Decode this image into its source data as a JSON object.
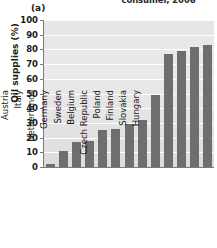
{
  "panel": {
    "label": "(a)"
  },
  "chart_data": {
    "type": "bar",
    "title": "consumer, 2006",
    "xlabel": "",
    "ylabel": "Oil supplies (%)",
    "ylim": [
      0,
      100
    ],
    "ytick_labels": [
      "100",
      "90",
      "80",
      "70",
      "60",
      "50",
      "40",
      "30",
      "20",
      "10",
      "0"
    ],
    "yticks": [
      100,
      90,
      80,
      70,
      60,
      50,
      40,
      30,
      20,
      10,
      0
    ],
    "grid": true,
    "legend": "none",
    "bar_color": "#6e6e6e",
    "plot_background": "#e6e6e6",
    "categories": [
      "Denmark",
      "France",
      "Austria",
      "Italy",
      "Netherlands",
      "Germany",
      "Sweden",
      "Belgium",
      "Czech Republic",
      "Poland",
      "Finland",
      "Slovakia",
      "Hungary"
    ],
    "values": [
      2,
      11,
      17,
      18,
      25,
      26,
      29,
      32,
      49,
      77,
      79,
      82,
      83
    ]
  }
}
